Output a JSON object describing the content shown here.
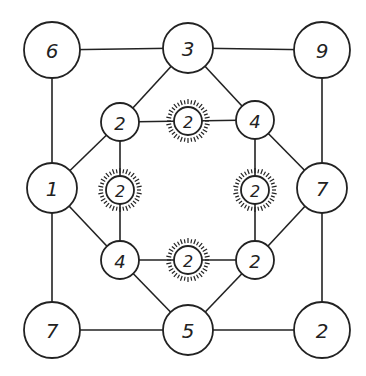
{
  "diagram": {
    "colors": {
      "stroke": "#222222",
      "background": "#ffffff"
    },
    "nodes": [
      {
        "id": "n_tl",
        "label": "6",
        "x": 52,
        "y": 50,
        "r": 28,
        "highlighted": false
      },
      {
        "id": "n_tm",
        "label": "3",
        "x": 188,
        "y": 48,
        "r": 25,
        "highlighted": false
      },
      {
        "id": "n_tr",
        "label": "9",
        "x": 322,
        "y": 50,
        "r": 28,
        "highlighted": false
      },
      {
        "id": "n_ml",
        "label": "1",
        "x": 52,
        "y": 188,
        "r": 25,
        "highlighted": false
      },
      {
        "id": "n_mr",
        "label": "7",
        "x": 322,
        "y": 188,
        "r": 25,
        "highlighted": false
      },
      {
        "id": "n_bl",
        "label": "7",
        "x": 52,
        "y": 330,
        "r": 28,
        "highlighted": false
      },
      {
        "id": "n_bm",
        "label": "5",
        "x": 188,
        "y": 330,
        "r": 25,
        "highlighted": false
      },
      {
        "id": "n_br",
        "label": "2",
        "x": 322,
        "y": 330,
        "r": 28,
        "highlighted": false
      },
      {
        "id": "i_tl",
        "label": "2",
        "x": 120,
        "y": 122,
        "r": 19,
        "highlighted": false
      },
      {
        "id": "i_tr",
        "label": "4",
        "x": 255,
        "y": 120,
        "r": 19,
        "highlighted": false
      },
      {
        "id": "i_bl",
        "label": "4",
        "x": 120,
        "y": 260,
        "r": 19,
        "highlighted": false
      },
      {
        "id": "i_br",
        "label": "2",
        "x": 255,
        "y": 260,
        "r": 19,
        "highlighted": false
      },
      {
        "id": "s_t",
        "label": "2",
        "x": 188,
        "y": 121,
        "r": 14,
        "highlighted": true
      },
      {
        "id": "s_l",
        "label": "2",
        "x": 120,
        "y": 190,
        "r": 14,
        "highlighted": true
      },
      {
        "id": "s_r",
        "label": "2",
        "x": 255,
        "y": 190,
        "r": 14,
        "highlighted": true
      },
      {
        "id": "s_b",
        "label": "2",
        "x": 188,
        "y": 260,
        "r": 14,
        "highlighted": true
      }
    ],
    "edges": [
      [
        "n_tl",
        "n_tm"
      ],
      [
        "n_tm",
        "n_tr"
      ],
      [
        "n_tl",
        "n_ml"
      ],
      [
        "n_ml",
        "n_bl"
      ],
      [
        "n_tr",
        "n_mr"
      ],
      [
        "n_mr",
        "n_br"
      ],
      [
        "n_bl",
        "n_bm"
      ],
      [
        "n_bm",
        "n_br"
      ],
      [
        "n_tm",
        "i_tl"
      ],
      [
        "n_tm",
        "i_tr"
      ],
      [
        "n_ml",
        "i_tl"
      ],
      [
        "n_ml",
        "i_bl"
      ],
      [
        "n_mr",
        "i_tr"
      ],
      [
        "n_mr",
        "i_br"
      ],
      [
        "n_bm",
        "i_bl"
      ],
      [
        "n_bm",
        "i_br"
      ],
      [
        "i_tl",
        "s_t"
      ],
      [
        "s_t",
        "i_tr"
      ],
      [
        "i_tl",
        "s_l"
      ],
      [
        "s_l",
        "i_bl"
      ],
      [
        "i_tr",
        "s_r"
      ],
      [
        "s_r",
        "i_br"
      ],
      [
        "i_bl",
        "s_b"
      ],
      [
        "s_b",
        "i_br"
      ]
    ]
  }
}
